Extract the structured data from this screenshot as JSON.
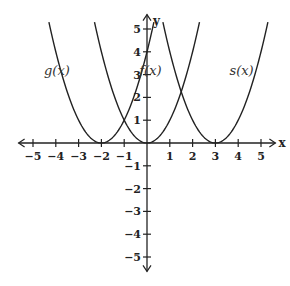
{
  "chart_data": {
    "type": "line",
    "title": "",
    "xlabel": "x",
    "ylabel": "y",
    "xlim": [
      -5.5,
      5.5
    ],
    "ylim": [
      -5.5,
      5.5
    ],
    "grid": false,
    "x_ticks": [
      -5,
      -4,
      -3,
      -2,
      -1,
      1,
      2,
      3,
      4,
      5
    ],
    "y_ticks": [
      -5,
      -4,
      -3,
      -2,
      -1,
      1,
      2,
      3,
      4,
      5
    ],
    "x_tick_labels": [
      "−5",
      "−4",
      "−3",
      "−2",
      "−1",
      "1",
      "2",
      "3",
      "4",
      "5"
    ],
    "y_tick_labels": [
      "−5",
      "−4",
      "−3",
      "−2",
      "−1",
      "1",
      "2",
      "3",
      "4",
      "5"
    ],
    "series": [
      {
        "name": "g(x)",
        "expression": "(x+2)^2",
        "vertex": [
          -2,
          0
        ],
        "y_max": 5.3
      },
      {
        "name": "f(x)",
        "expression": "x^2",
        "vertex": [
          0,
          0
        ],
        "y_max": 5.3
      },
      {
        "name": "s(x)",
        "expression": "(x-3)^2",
        "vertex": [
          3,
          0
        ],
        "y_max": 5.3
      }
    ],
    "labels": [
      {
        "text": "g(x)",
        "series": "g(x)"
      },
      {
        "text": "f(x)",
        "series": "f(x)"
      },
      {
        "text": "s(x)",
        "series": "s(x)"
      }
    ]
  }
}
